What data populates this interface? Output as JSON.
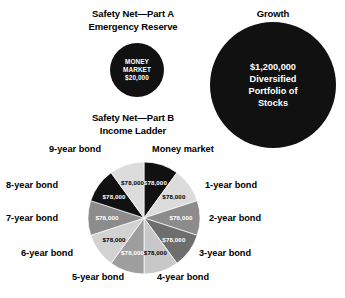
{
  "sections": {
    "part_a": {
      "heading_line1": "Safety Net—Part A",
      "heading_line2": "Emergency Reserve",
      "circle": {
        "line1": "MONEY",
        "line2": "MARKET",
        "line3": "$20,000",
        "fill": "#111111",
        "text_color": "#FFFFFF"
      }
    },
    "growth": {
      "heading": "Growth",
      "circle": {
        "line1": "$1,200,000",
        "line2": "Diversified",
        "line3": "Portfolio of",
        "line4": "Stocks",
        "fill": "#111111",
        "text_color": "#FFFFFF"
      }
    },
    "part_b": {
      "heading_line1": "Safety Net—Part B",
      "heading_line2": "Income Ladder"
    }
  },
  "chart_data": {
    "type": "pie",
    "title": "Safety Net—Part B Income Ladder",
    "legend": "none",
    "total": 780000,
    "categories": [
      "Money market",
      "1-year bond",
      "2-year bond",
      "3-year bond",
      "4-year bond",
      "5-year bond",
      "6-year bond",
      "7-year bond",
      "8-year bond",
      "9-year bond"
    ],
    "values": [
      78000,
      78000,
      78000,
      78000,
      78000,
      78000,
      78000,
      78000,
      78000,
      78000
    ],
    "value_labels": [
      "$78,000",
      "$78,000",
      "$78,000",
      "$78,000",
      "$78,000",
      "$78,000",
      "$78,000",
      "$78,000",
      "$78,000",
      "$78,000"
    ],
    "slice_percent": 10,
    "slice_colors": [
      "#111111",
      "#DCDCDC",
      "#8C8C8C",
      "#6E6E6E",
      "#C8C8C8",
      "#9E9E9E",
      "#D2D2D2",
      "#8C8C8C",
      "#111111",
      "#DCDCDC"
    ],
    "slice_label_colors": [
      "#FFFFFF",
      "#000000",
      "#FFFFFF",
      "#FFFFFF",
      "#000000",
      "#FFFFFF",
      "#000000",
      "#FFFFFF",
      "#FFFFFF",
      "#000000"
    ]
  },
  "pie_labels": [
    {
      "text": "Money market"
    },
    {
      "text": "1-year bond"
    },
    {
      "text": "2-year bond"
    },
    {
      "text": "3-year bond"
    },
    {
      "text": "4-year bond"
    },
    {
      "text": "5-year bond"
    },
    {
      "text": "6-year bond"
    },
    {
      "text": "7-year bond"
    },
    {
      "text": "8-year bond"
    },
    {
      "text": "9-year bond"
    }
  ]
}
